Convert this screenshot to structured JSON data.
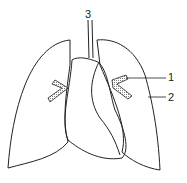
{
  "diagram": {
    "labels": [
      {
        "id": "1",
        "text": "1",
        "x": 168,
        "y": 72
      },
      {
        "id": "2",
        "text": "2",
        "x": 168,
        "y": 92
      },
      {
        "id": "3",
        "text": "3",
        "x": 85,
        "y": 9
      }
    ],
    "colors": {
      "stroke": "#222222",
      "hatch": "#999999",
      "background": "#ffffff"
    }
  }
}
